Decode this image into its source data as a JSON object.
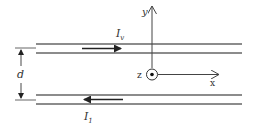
{
  "diagram": {
    "axes": {
      "y_label": "y",
      "x_label": "x",
      "z_label": "z"
    },
    "top_wire": {
      "current_label": "I",
      "current_subscript": "v",
      "direction": "right"
    },
    "bottom_wire": {
      "current_label": "I",
      "current_subscript": "1",
      "direction": "left"
    },
    "separation_label": "d",
    "colors": {
      "line": "#555555",
      "arrow": "#222222",
      "text": "#333333"
    }
  }
}
